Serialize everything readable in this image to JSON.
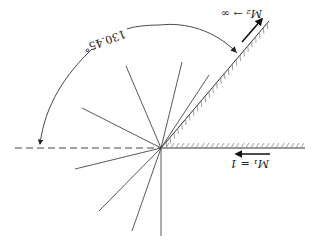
{
  "figure": {
    "orientation": "rotated 180 degrees",
    "angle_label": "130.45°",
    "upstream_label": "M₁ = 1",
    "downstream_label": "M₂ → ∞",
    "colors": {
      "line": "#333333",
      "hatch": "#888888",
      "background": "#ffffff"
    }
  },
  "geometry": {
    "center": [
      161,
      148
    ],
    "wall_horizontal_end": [
      305,
      148
    ],
    "wall_inclined_end": [
      269,
      21
    ],
    "dashed_reference_start": [
      15,
      148
    ],
    "rays": [
      [
        126,
        66
      ],
      [
        82,
        108
      ],
      [
        182,
        62
      ],
      [
        209,
        75
      ],
      [
        75,
        169
      ],
      [
        99,
        211
      ],
      [
        132,
        231
      ],
      [
        161,
        236
      ]
    ]
  }
}
